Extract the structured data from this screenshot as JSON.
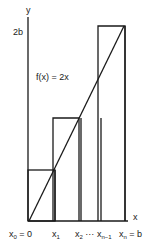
{
  "diagram": {
    "function_label": "f(x) = 2x",
    "y_axis_label": "y",
    "x_axis_label": "x",
    "y_tick_label": "2b",
    "x_ticks": [
      {
        "base": "x",
        "sub": "0",
        "suffix": " = 0"
      },
      {
        "base": "x",
        "sub": "1",
        "suffix": ""
      },
      {
        "base": "x",
        "sub": "2",
        "suffix": " ···"
      },
      {
        "base": "x",
        "sub": "n−1",
        "suffix": ""
      },
      {
        "base": "x",
        "sub": "n",
        "suffix": " = b"
      }
    ],
    "line_color": "#1a1a1a"
  }
}
